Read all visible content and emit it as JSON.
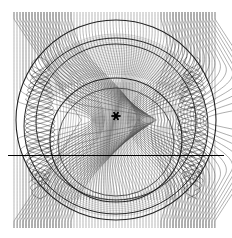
{
  "figure": {
    "domain": "Chart",
    "title": "",
    "background_color": "#ffffff",
    "width": 232,
    "height": 238
  },
  "chart_data": {
    "type": "line",
    "title": "",
    "subtitle": "",
    "xlabel": "",
    "ylabel": "",
    "grid": false,
    "legend": null,
    "legend_position": "none",
    "xlim": [
      0,
      232
    ],
    "ylim": [
      238,
      0
    ],
    "colors": {
      "ray_light": "#8c8c8c",
      "ray_mid": "#555555",
      "ray_dark": "#1a1a1a",
      "caustic": "#111111",
      "axis_line": "#000000",
      "marker": "#000000",
      "background": "#ffffff"
    },
    "ray_field": {
      "name": "incident rays",
      "count": 68,
      "x_start": 14,
      "x_end": 218,
      "spacing": 3.0,
      "y_top": 12,
      "y_bottom": 228,
      "stroke_width": 0.75,
      "color": "#6e6e6e"
    },
    "lens": {
      "name": "circular refracting region",
      "center_x": 116,
      "center_y": 120,
      "radius": 101,
      "refraction_strength": 1.62
    },
    "caustics": [
      {
        "name": "outer caustic circle",
        "center_x": 116,
        "center_y": 120,
        "rx": 100,
        "ry": 100,
        "stroke_width": 1.1,
        "color": "#111111"
      },
      {
        "name": "upper dense caustic band",
        "center_x": 116,
        "center_y": 126,
        "rx": 92,
        "ry": 88,
        "stroke_width": 1.0,
        "color": "#1a1a1a"
      },
      {
        "name": "mid caustic arc",
        "center_x": 116,
        "center_y": 122,
        "rx": 80,
        "ry": 78,
        "stroke_width": 1.0,
        "color": "#222222"
      },
      {
        "name": "inner caustic oval",
        "center_x": 116,
        "center_y": 140,
        "rx": 66,
        "ry": 62,
        "stroke_width": 1.1,
        "color": "#111111"
      },
      {
        "name": "inner caustic oval secondary",
        "center_x": 116,
        "center_y": 142,
        "rx": 58,
        "ry": 54,
        "stroke_width": 0.9,
        "color": "#333333"
      }
    ],
    "axis_line": {
      "name": "optical axis",
      "x1": 8,
      "x2": 224,
      "y": 155,
      "stroke_width": 1.2,
      "color": "#000000"
    },
    "source_marker": {
      "name": "focus marker",
      "glyph": "asterisk",
      "x": 116,
      "y": 116,
      "size": 9,
      "color": "#000000"
    },
    "lattice_regions": [
      {
        "name": "left woven caustic lattice",
        "x_center": 40,
        "y_center": 128,
        "half_width": 24,
        "half_height": 58
      },
      {
        "name": "right woven caustic lattice",
        "x_center": 192,
        "y_center": 128,
        "half_width": 24,
        "half_height": 58
      }
    ]
  }
}
